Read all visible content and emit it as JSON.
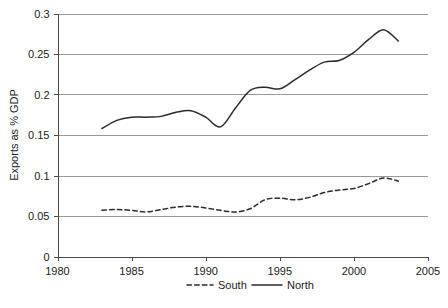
{
  "chart_data": {
    "type": "line",
    "title": "",
    "subtitle": "",
    "xlabel": "",
    "ylabel": "Exports as % GDP",
    "xlim": [
      1980,
      2005
    ],
    "ylim": [
      0,
      0.3
    ],
    "grid": true,
    "grid_axis": "y",
    "legend_position": "bottom",
    "x_ticks": [
      "1980",
      "1985",
      "1990",
      "1995",
      "2000",
      "2005"
    ],
    "x_tick_values": [
      1980,
      1985,
      1990,
      1995,
      2000,
      2005
    ],
    "y_ticks": [
      "0",
      "0.05",
      "0.1",
      "0.15",
      "0.2",
      "0.25",
      "0.3"
    ],
    "y_tick_values": [
      0,
      0.05,
      0.1,
      0.15,
      0.2,
      0.25,
      0.3
    ],
    "x": [
      1983,
      1984,
      1985,
      1986,
      1987,
      1988,
      1989,
      1990,
      1991,
      1992,
      1993,
      1994,
      1995,
      1996,
      1997,
      1998,
      1999,
      2000,
      2001,
      2002,
      2003
    ],
    "series": [
      {
        "name": "South",
        "style": "dashed",
        "color": "#2b2b2b",
        "values": [
          0.057,
          0.058,
          0.057,
          0.055,
          0.058,
          0.061,
          0.062,
          0.06,
          0.057,
          0.055,
          0.059,
          0.07,
          0.072,
          0.07,
          0.073,
          0.079,
          0.082,
          0.084,
          0.09,
          0.097,
          0.093
        ]
      },
      {
        "name": "North",
        "style": "solid",
        "color": "#2b2b2b",
        "values": [
          0.158,
          0.168,
          0.172,
          0.172,
          0.173,
          0.178,
          0.18,
          0.172,
          0.16,
          0.183,
          0.205,
          0.209,
          0.207,
          0.218,
          0.23,
          0.24,
          0.242,
          0.252,
          0.268,
          0.28,
          0.266
        ]
      }
    ]
  },
  "legend": {
    "items": [
      {
        "label": "South",
        "style": "dashed"
      },
      {
        "label": "North",
        "style": "solid"
      }
    ]
  },
  "axes": {
    "y_title": "Exports as % GDP"
  }
}
